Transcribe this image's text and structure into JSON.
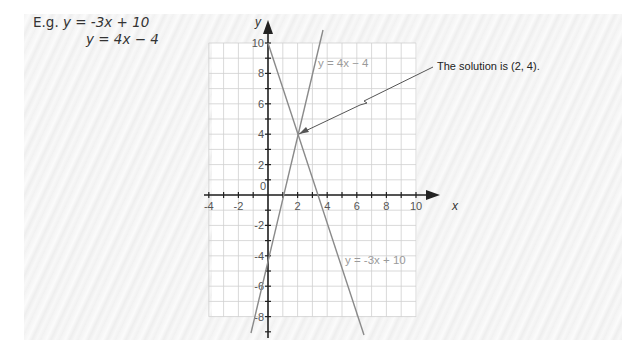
{
  "example": {
    "prefix": "E.g. ",
    "eq1": "y = -3x + 10",
    "eq2": "y = 4x − 4"
  },
  "chart_data": {
    "type": "line",
    "title": "",
    "xlabel": "x",
    "ylabel": "y",
    "xlim": [
      -4,
      10
    ],
    "ylim": [
      -8,
      10
    ],
    "grid": true,
    "x_ticks": [
      -4,
      -2,
      0,
      2,
      4,
      6,
      8,
      10
    ],
    "y_ticks": [
      -8,
      -6,
      -4,
      -2,
      0,
      2,
      4,
      6,
      8,
      10
    ],
    "x_tick_labels": [
      "-4",
      "-2",
      "0",
      "2",
      "4",
      "6",
      "8",
      "10"
    ],
    "y_tick_labels": [
      "-8",
      "-6",
      "-4",
      "-2",
      "2",
      "4",
      "6",
      "8",
      "10"
    ],
    "series": [
      {
        "name": "y = 4x − 4",
        "x": [
          -1.15,
          3.7
        ],
        "y": [
          -8.6,
          10.8
        ],
        "color": "#8a8a8a"
      },
      {
        "name": "y = -3x + 10",
        "x": [
          0,
          6.5
        ],
        "y": [
          10,
          -9.5
        ],
        "color": "#8a8a8a"
      }
    ],
    "annotations": [
      {
        "text": "The solution is (2, 4).",
        "point": [
          2,
          4
        ]
      }
    ],
    "legend_labels": {
      "line1": "y = 4x − 4",
      "line2": "y = -3x + 10"
    }
  },
  "annotation": {
    "text": "The solution is (2, 4)."
  },
  "axis": {
    "x": "x",
    "y": "y"
  }
}
